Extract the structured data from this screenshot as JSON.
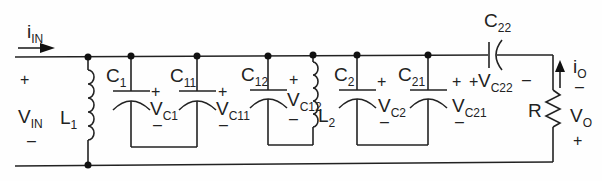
{
  "diagram": {
    "type": "circuit-schematic",
    "input": {
      "current": {
        "main": "i",
        "sub": "IN"
      },
      "voltage": {
        "main": "V",
        "sub": "IN"
      },
      "plus": "+",
      "minus": "–"
    },
    "components": [
      {
        "id": "L1",
        "main": "L",
        "sub": "1",
        "type": "inductor"
      },
      {
        "id": "C1",
        "main": "C",
        "sub": "1",
        "type": "capacitor",
        "voltage": {
          "main": "V",
          "sub": "C1"
        }
      },
      {
        "id": "C11",
        "main": "C",
        "sub": "11",
        "type": "capacitor",
        "voltage": {
          "main": "V",
          "sub": "C11"
        }
      },
      {
        "id": "C12",
        "main": "C",
        "sub": "12",
        "type": "capacitor",
        "voltage": {
          "main": "V",
          "sub": "C12"
        }
      },
      {
        "id": "L2",
        "main": "L",
        "sub": "2",
        "type": "inductor"
      },
      {
        "id": "C2",
        "main": "C",
        "sub": "2",
        "type": "capacitor",
        "voltage": {
          "main": "V",
          "sub": "C2"
        }
      },
      {
        "id": "C21",
        "main": "C",
        "sub": "21",
        "type": "capacitor",
        "voltage": {
          "main": "V",
          "sub": "C21"
        }
      },
      {
        "id": "C22",
        "main": "C",
        "sub": "22",
        "type": "capacitor",
        "voltage": {
          "main": "V",
          "sub": "C22"
        }
      },
      {
        "id": "R",
        "main": "R",
        "sub": "",
        "type": "resistor"
      }
    ],
    "output": {
      "current": {
        "main": "i",
        "sub": "O"
      },
      "voltage": {
        "main": "V",
        "sub": "O"
      },
      "plus": "+",
      "minus": "–"
    },
    "signs": {
      "plus": "+",
      "minus": "–"
    }
  }
}
